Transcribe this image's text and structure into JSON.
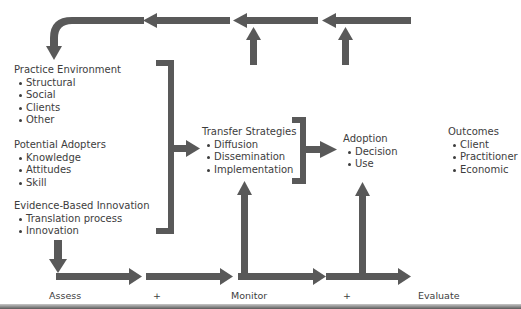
{
  "diagram": {
    "colors": {
      "arrow": "#595959",
      "text": "#3d3d3d",
      "background": "#ffffff"
    },
    "blocks": {
      "practice_environment": {
        "title": "Practice Environment",
        "items": [
          "Structural",
          "Social",
          "Clients",
          "Other"
        ]
      },
      "potential_adopters": {
        "title": "Potential Adopters",
        "items": [
          "Knowledge",
          "Attitudes",
          "Skill"
        ]
      },
      "evidence_based_innovation": {
        "title": "Evidence-Based Innovation",
        "items": [
          "Translation process",
          "Innovation"
        ]
      },
      "transfer_strategies": {
        "title": "Transfer Strategies",
        "items": [
          "Diffusion",
          "Dissemination",
          "Implementation"
        ]
      },
      "adoption": {
        "title": "Adoption",
        "items": [
          "Decision",
          "Use"
        ]
      },
      "outcomes": {
        "title": "Outcomes",
        "items": [
          "Client",
          "Practitioner",
          "Economic"
        ]
      }
    },
    "phases": {
      "assess": "Assess",
      "plus_1": "+",
      "monitor": "Monitor",
      "plus_2": "+",
      "evaluate": "Evaluate"
    },
    "icons": {
      "arrows": "arrow-icon",
      "brackets": "bracket-icon"
    }
  }
}
